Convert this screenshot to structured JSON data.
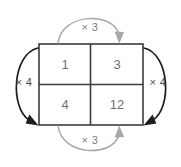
{
  "diagram": {
    "type": "ratio-table-multiplier",
    "background_color": "#ffffff",
    "grid": {
      "border_color": "#3c3c3c",
      "cell_text_color": "#70706f",
      "rows": [
        {
          "cells": [
            {
              "value": "1"
            },
            {
              "value": "3"
            }
          ]
        },
        {
          "cells": [
            {
              "value": "4"
            },
            {
              "value": "12"
            }
          ]
        }
      ]
    },
    "arrows": [
      {
        "id": "top",
        "label": "× 3",
        "color": "#a8a8a8",
        "label_color": "#7d7d7d",
        "position": "top",
        "direction": "left-to-right",
        "arrowhead": "down",
        "relates": "1 to 3"
      },
      {
        "id": "bottom",
        "label": "× 3",
        "color": "#a8a8a8",
        "label_color": "#7d7d7d",
        "position": "bottom",
        "direction": "left-to-right",
        "arrowhead": "up",
        "relates": "4 to 12"
      },
      {
        "id": "left",
        "label": "× 4",
        "color": "#1d1d1d",
        "label_color": "#4a4a4a",
        "position": "left",
        "direction": "top-to-bottom",
        "arrowhead": "down-right",
        "relates": "1 to 4"
      },
      {
        "id": "right",
        "label": "× 4",
        "color": "#1d1d1d",
        "label_color": "#4a4a4a",
        "position": "right",
        "direction": "top-to-bottom",
        "arrowhead": "down-left",
        "relates": "3 to 12"
      }
    ]
  }
}
